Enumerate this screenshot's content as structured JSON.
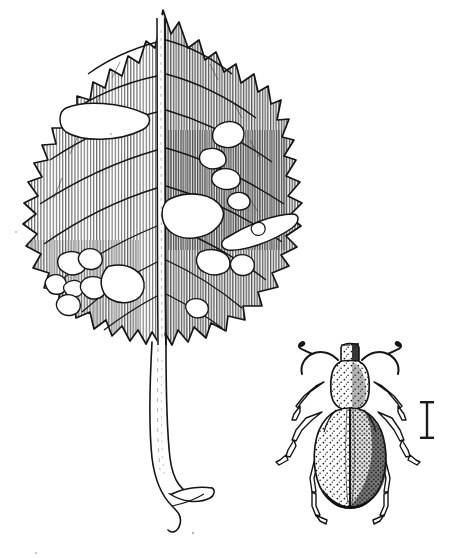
{
  "figure": {
    "type": "scientific-line-illustration",
    "medium": "pen-and-ink stipple and hatch drawing",
    "background_color": "#ffffff",
    "ink_color": "#1a1a1a",
    "hatch_color": "#5a5a5a",
    "caption": "",
    "title": "",
    "has_visible_text": false,
    "width_px": 454,
    "height_px": 557
  },
  "subjects": {
    "leaf": {
      "name": "oak leaf with feeding damage",
      "description": "Lobed oak leaf rendered in fine vertical hatching, riddled with irregular holes and elongate skeletonized windows from beetle feeding; long curving petiole with flared base.",
      "outline_color": "#1a1a1a",
      "shading": "vertical line hatching",
      "midrib": "pale central band flanked by dark veins",
      "lobe_count": 9,
      "hole_count": 22,
      "bounds": {
        "x": 18,
        "y": 8,
        "width": 290,
        "height": 520
      }
    },
    "beetle": {
      "name": "weevil (adult beetle)",
      "description": "Dorsal view of a broad-nosed weevil with clubbed elbowed antennae, stippled pronotum and elytra, dark elytral suture, and six slender legs.",
      "body_color": "#f2f2f2",
      "stipple_color": "#1a1a1a",
      "antennae": 2,
      "legs": 6,
      "bounds": {
        "x": 296,
        "y": 338,
        "width": 108,
        "height": 190
      }
    },
    "scale_bar": {
      "name": "scale bar",
      "glyph": "I",
      "orientation": "vertical",
      "label": "",
      "bounds": {
        "x": 420,
        "y": 400,
        "width": 14,
        "height": 40
      }
    }
  },
  "leaf_holes": [
    {
      "cx": 108,
      "cy": 124,
      "rx": 44,
      "ry": 16,
      "rot": -18
    },
    {
      "cx": 231,
      "cy": 135,
      "rx": 16,
      "ry": 13,
      "rot": 0
    },
    {
      "cx": 215,
      "cy": 156,
      "rx": 12,
      "ry": 9,
      "rot": 10
    },
    {
      "cx": 228,
      "cy": 176,
      "rx": 14,
      "ry": 10,
      "rot": -5
    },
    {
      "cx": 196,
      "cy": 215,
      "rx": 26,
      "ry": 19,
      "rot": 8
    },
    {
      "cx": 235,
      "cy": 202,
      "rx": 11,
      "ry": 8,
      "rot": 0
    },
    {
      "cx": 262,
      "cy": 228,
      "rx": 36,
      "ry": 11,
      "rot": -14
    },
    {
      "cx": 214,
      "cy": 263,
      "rx": 16,
      "ry": 12,
      "rot": 0
    },
    {
      "cx": 240,
      "cy": 266,
      "rx": 11,
      "ry": 9,
      "rot": 0
    },
    {
      "cx": 70,
      "cy": 265,
      "rx": 12,
      "ry": 10,
      "rot": 0
    },
    {
      "cx": 88,
      "cy": 262,
      "rx": 9,
      "ry": 8,
      "rot": 0
    },
    {
      "cx": 58,
      "cy": 284,
      "rx": 9,
      "ry": 8,
      "rot": 0
    },
    {
      "cx": 74,
      "cy": 288,
      "rx": 7,
      "ry": 6,
      "rot": 0
    },
    {
      "cx": 88,
      "cy": 290,
      "rx": 9,
      "ry": 8,
      "rot": 0
    },
    {
      "cx": 72,
      "cy": 303,
      "rx": 8,
      "ry": 8,
      "rot": 0
    },
    {
      "cx": 123,
      "cy": 284,
      "rx": 20,
      "ry": 15,
      "rot": 12
    }
  ]
}
